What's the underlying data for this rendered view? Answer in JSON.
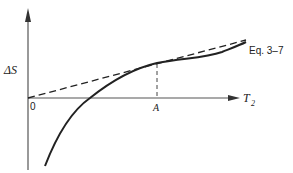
{
  "diagram": {
    "y_axis_label": "ΔS",
    "x_axis_label": "T",
    "x_axis_subscript": "2",
    "origin_label": "0",
    "point_label": "A",
    "curve_label": "Eq. 3–7",
    "colors": {
      "ink": "#222222",
      "axis": "#555555",
      "background": "#ffffff"
    }
  }
}
